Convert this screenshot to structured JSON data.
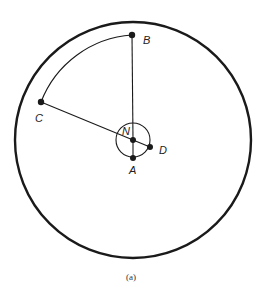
{
  "figure": {
    "caption": "(a)",
    "colors": {
      "stroke": "#1a1a1a",
      "background": "#ffffff"
    },
    "outer_circle": {
      "cx": 133,
      "cy": 140,
      "r": 118
    },
    "small_circle": {
      "cx": 133,
      "cy": 140,
      "r": 17
    },
    "points": [
      {
        "id": "B",
        "label": "B",
        "x": 132,
        "y": 35,
        "lx": 143,
        "ly": 44
      },
      {
        "id": "C",
        "label": "C",
        "x": 41,
        "y": 102,
        "lx": 35,
        "ly": 122
      },
      {
        "id": "N",
        "label": "N",
        "x": 133,
        "y": 140,
        "lx": 122,
        "ly": 133
      },
      {
        "id": "D",
        "label": "D",
        "x": 150,
        "y": 147,
        "lx": 159,
        "ly": 154
      },
      {
        "id": "A",
        "label": "A",
        "x": 133,
        "y": 158,
        "lx": 129,
        "ly": 174
      }
    ]
  }
}
